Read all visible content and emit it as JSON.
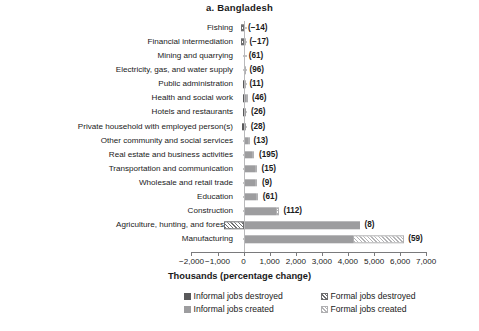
{
  "chart_data": {
    "type": "bar",
    "orientation": "horizontal",
    "stacked": true,
    "title": "a. Bangladesh",
    "xlabel": "Thousands (percentage change)",
    "ylabel": "",
    "xlim": [
      -2000,
      7000
    ],
    "xticks": [
      -2000,
      -1000,
      0,
      1000,
      2000,
      3000,
      4000,
      5000,
      6000,
      7000
    ],
    "xtick_labels": [
      "−2,000",
      "−1,000",
      "0",
      "1,000",
      "2,000",
      "3,000",
      "4,000",
      "5,000",
      "6,000",
      "7,000"
    ],
    "grid": false,
    "legend_position": "bottom",
    "categories": [
      "Fishing",
      "Financial intermediation",
      "Mining and quarrying",
      "Electricity, gas, and water supply",
      "Public administration",
      "Health and social work",
      "Hotels and restaurants",
      "Private household with employed person(s)",
      "Other community and social services",
      "Real estate and business activities",
      "Transportation and communication",
      "Wholesale and retail trade",
      "Education",
      "Construction",
      "Agriculture, hunting, and forestry",
      "Manufacturing"
    ],
    "series": [
      {
        "name": "Informal jobs destroyed",
        "color": "#59595b",
        "pattern": "solid",
        "values": [
          0,
          0,
          0,
          0,
          -20,
          -20,
          -40,
          -50,
          0,
          0,
          0,
          0,
          0,
          0,
          0,
          0
        ]
      },
      {
        "name": "Formal jobs destroyed",
        "color": "#6e6e70",
        "pattern": "hatch-dark",
        "values": [
          -110,
          -100,
          0,
          0,
          0,
          0,
          0,
          0,
          0,
          0,
          0,
          0,
          0,
          0,
          -750,
          0
        ]
      },
      {
        "name": "Informal jobs created",
        "color": "#9d9d9f",
        "pattern": "solid",
        "values": [
          0,
          0,
          25,
          30,
          20,
          90,
          110,
          100,
          150,
          320,
          420,
          440,
          460,
          1260,
          4460,
          4180
        ]
      },
      {
        "name": "Formal jobs created",
        "color": "#b4b4b6",
        "pattern": "hatch-light",
        "values": [
          0,
          50,
          0,
          25,
          30,
          60,
          0,
          0,
          55,
          95,
          95,
          90,
          105,
          95,
          0,
          1960
        ]
      }
    ],
    "data_labels": [
      "(−14)",
      "(−17)",
      "(61)",
      "(96)",
      "(11)",
      "(46)",
      "(26)",
      "(28)",
      "(13)",
      "(195)",
      "(15)",
      "(9)",
      "(61)",
      "(112)",
      "(8)",
      "(59)"
    ]
  },
  "legend": {
    "items": [
      {
        "label": "Informal jobs destroyed",
        "swatch": "solid-dark"
      },
      {
        "label": "Formal jobs destroyed",
        "swatch": "hatch-dark"
      },
      {
        "label": "Informal jobs created",
        "swatch": "solid-gray"
      },
      {
        "label": "Formal jobs created",
        "swatch": "hatch-light"
      }
    ]
  }
}
